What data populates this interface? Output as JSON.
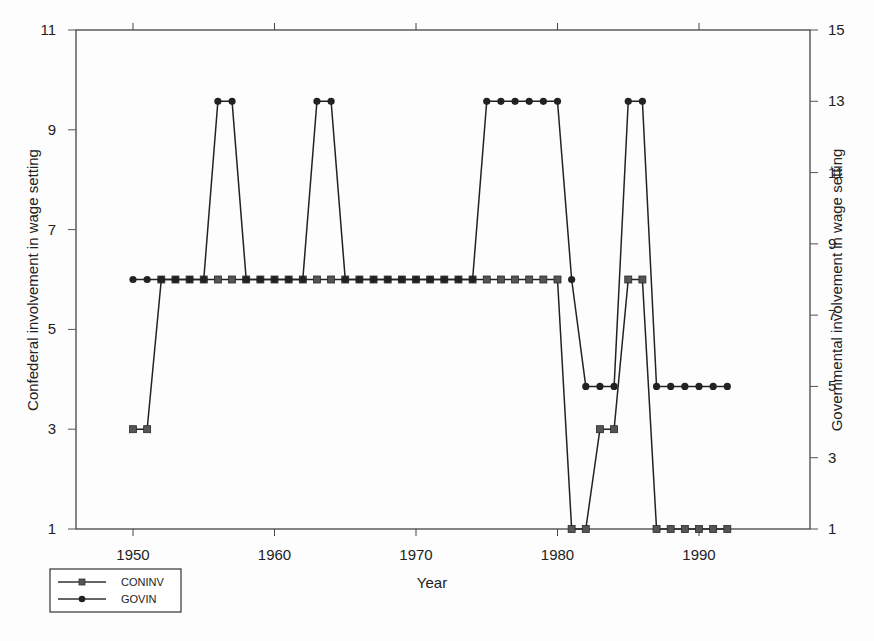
{
  "chart_data": {
    "type": "line",
    "title": "",
    "xlabel": "Year",
    "ylabel": "Confederal involvement in wage setting",
    "y2label": "Governmental involvement in wage setting",
    "xlim": [
      1946,
      1996
    ],
    "ylim": [
      1,
      11
    ],
    "y2lim": [
      1,
      15
    ],
    "x_ticks": [
      1950,
      1960,
      1970,
      1980,
      1990
    ],
    "y_ticks": [
      1,
      3,
      5,
      7,
      9,
      11
    ],
    "y2_ticks": [
      1,
      3,
      5,
      7,
      9,
      11,
      13,
      15
    ],
    "grid": false,
    "legend_position": "bottom-left",
    "x": [
      1950,
      1951,
      1952,
      1953,
      1954,
      1955,
      1956,
      1957,
      1958,
      1959,
      1960,
      1961,
      1962,
      1963,
      1964,
      1965,
      1966,
      1967,
      1968,
      1969,
      1970,
      1971,
      1972,
      1973,
      1974,
      1975,
      1976,
      1977,
      1978,
      1979,
      1980,
      1981,
      1982,
      1983,
      1984,
      1985,
      1986,
      1987,
      1988,
      1989,
      1990,
      1991,
      1992
    ],
    "series": [
      {
        "name": "CONINV",
        "axis": "left",
        "marker": "square",
        "color": "#444444",
        "values": [
          3,
          3,
          6,
          6,
          6,
          6,
          6,
          6,
          6,
          6,
          6,
          6,
          6,
          6,
          6,
          6,
          6,
          6,
          6,
          6,
          6,
          6,
          6,
          6,
          6,
          6,
          6,
          6,
          6,
          6,
          6,
          1,
          1,
          3,
          3,
          6,
          6,
          1,
          1,
          1,
          1,
          1,
          1
        ]
      },
      {
        "name": "GOVIN",
        "axis": "right",
        "marker": "circle",
        "color": "#222222",
        "values": [
          8,
          8,
          8,
          8,
          8,
          8,
          13,
          13,
          8,
          8,
          8,
          8,
          8,
          13,
          13,
          8,
          8,
          8,
          8,
          8,
          8,
          8,
          8,
          8,
          8,
          13,
          13,
          13,
          13,
          13,
          13,
          8,
          5,
          5,
          5,
          13,
          13,
          5,
          5,
          5,
          5,
          5,
          5
        ]
      }
    ]
  },
  "legend": {
    "items": [
      {
        "label": "CONINV",
        "marker": "square"
      },
      {
        "label": "GOVIN",
        "marker": "circle"
      }
    ]
  }
}
